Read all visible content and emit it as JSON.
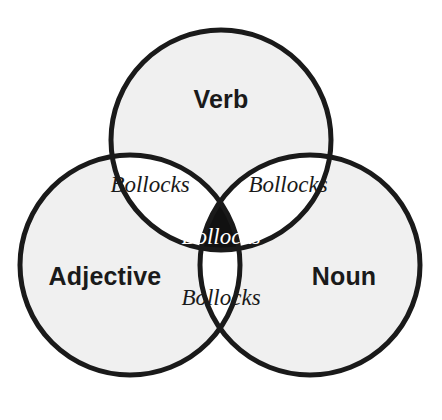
{
  "diagram": {
    "type": "venn-3-set",
    "title": "",
    "background_color": "#ffffff",
    "circle_fill_color": "#f0f0f0",
    "circle_stroke_color": "#1a1a1a",
    "circle_stroke_width": 5,
    "pairwise_intersection_fill": "#ffffff",
    "triple_intersection_fill": "#111111",
    "label_color": "#1a1a1a",
    "inverse_label_color": "#ffffff",
    "sets": [
      {
        "id": "verb",
        "label": "Verb",
        "position": "top",
        "center_x": 221,
        "center_y": 140,
        "radius": 110,
        "label_x": 221,
        "label_y": 108
      },
      {
        "id": "adjective",
        "label": "Adjective",
        "position": "bottom-left",
        "center_x": 130,
        "center_y": 265,
        "radius": 110,
        "label_x": 105,
        "label_y": 285
      },
      {
        "id": "noun",
        "label": "Noun",
        "position": "bottom-right",
        "center_x": 310,
        "center_y": 265,
        "radius": 110,
        "label_x": 344,
        "label_y": 285
      }
    ],
    "regions": [
      {
        "id": "verb-adjective",
        "label": "Bollocks",
        "sets": [
          "verb",
          "adjective"
        ],
        "fill": "#ffffff",
        "text_color": "#1a1a1a",
        "label_x": 150,
        "label_y": 192
      },
      {
        "id": "verb-noun",
        "label": "Bollocks",
        "sets": [
          "verb",
          "noun"
        ],
        "fill": "#ffffff",
        "text_color": "#1a1a1a",
        "label_x": 288,
        "label_y": 192
      },
      {
        "id": "verb-adjective-noun",
        "label": "Bollocks",
        "sets": [
          "verb",
          "adjective",
          "noun"
        ],
        "fill": "#111111",
        "text_color": "#ffffff",
        "label_x": 221,
        "label_y": 244
      },
      {
        "id": "adjective-noun",
        "label": "Bollocks",
        "sets": [
          "adjective",
          "noun"
        ],
        "fill": "#ffffff",
        "text_color": "#1a1a1a",
        "label_x": 221,
        "label_y": 305
      }
    ]
  }
}
